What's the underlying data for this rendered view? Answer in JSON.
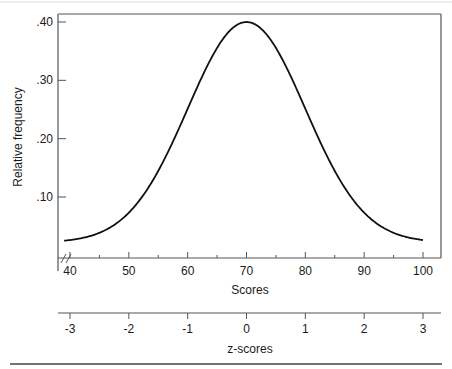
{
  "chart_data": {
    "type": "line",
    "title": "",
    "xlabel": "Scores",
    "ylabel": "Relative frequency",
    "xlim": [
      37,
      101
    ],
    "ylim": [
      0.012,
      0.412
    ],
    "x_ticks": [
      40,
      50,
      60,
      70,
      80,
      90,
      100
    ],
    "x_tick_labels": [
      "40",
      "50",
      "60",
      "70",
      "80",
      "90",
      "100"
    ],
    "x_minor_ticks": [
      45,
      55,
      65,
      75,
      85,
      95
    ],
    "y_ticks": [
      0.1,
      0.2,
      0.3,
      0.4
    ],
    "y_tick_labels": [
      ".10",
      ".20",
      ".30",
      ".40"
    ],
    "axis_break": "x-axis break mark at left",
    "grid": false,
    "legend": "none",
    "series": [
      {
        "name": "Normal distribution of scores",
        "distribution": "normal",
        "mean": 70,
        "sd": 10,
        "peak_relative_frequency": 0.4,
        "x": [
          39,
          40,
          42,
          44,
          46,
          48,
          50,
          52,
          54,
          56,
          58,
          60,
          62,
          64,
          66,
          68,
          70,
          72,
          74,
          76,
          78,
          80,
          82,
          84,
          86,
          88,
          90,
          92,
          94,
          96,
          98,
          100
        ],
        "values": [
          0.022,
          0.022,
          0.028,
          0.036,
          0.045,
          0.058,
          0.072,
          0.098,
          0.136,
          0.18,
          0.226,
          0.276,
          0.322,
          0.362,
          0.388,
          0.4,
          0.4,
          0.392,
          0.37,
          0.334,
          0.29,
          0.242,
          0.196,
          0.154,
          0.114,
          0.08,
          0.056,
          0.04,
          0.03,
          0.024,
          0.022,
          0.022
        ]
      }
    ],
    "secondary_axis": {
      "label": "z-scores",
      "ticks": [
        -3,
        -2,
        -1,
        0,
        1,
        2,
        3
      ],
      "tick_labels": [
        "-3",
        "-2",
        "-1",
        "0",
        "1",
        "2",
        "3"
      ],
      "aligned_with_scores": [
        40,
        50,
        60,
        70,
        80,
        90,
        100
      ]
    }
  }
}
